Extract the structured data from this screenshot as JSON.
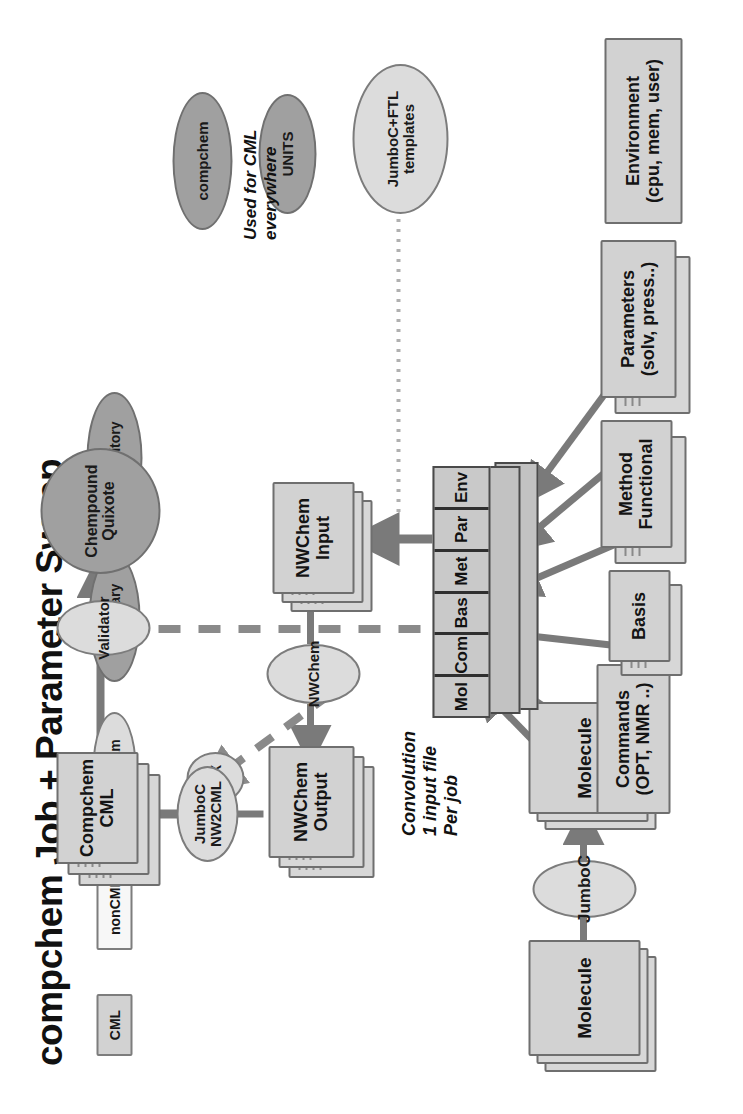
{
  "title": "compchem Job + Parameter Sweep",
  "legend": {
    "cml": "CML",
    "noncml": "nonCML",
    "program": "Program",
    "dictionary": "Dictionary",
    "repository": "Repository"
  },
  "notes": {
    "convolution": "Convolution\n1 input file\nPer job",
    "used_for_cml": "Used for CML\neverywhere"
  },
  "nodes": {
    "molecule_in": "Molecule",
    "jumboc": "JumboC",
    "molecule_cml": "Molecule",
    "commands": "Commands\n(OPT, NMR ..)",
    "basis": "Basis",
    "method": "Method\nFunctional",
    "parameters": "Parameters\n(solv, press..)",
    "environment": "Environment\n(cpu, mem, user)",
    "seg_cells": [
      "Mol",
      "Com",
      "Bas",
      "Met",
      "Par",
      "Env"
    ],
    "nwchem_input": "NWChem\nInput",
    "nwchem_prog": "NWChem",
    "nwchem_output": "NWChem\nOutput",
    "fox": "FoX",
    "jumboc_nw2cml": "JumboC\nNW2CML",
    "compchem_cml": "Compchem\nCML",
    "validator": "Validator",
    "chempound": "Chempound\nQuixote",
    "jumboc_ftl": "JumboC+FTL\ntemplates",
    "compchem_dict": "compchem",
    "units_dict": "UNITS"
  },
  "colors": {
    "cml_fill": "#d2d2d2",
    "noncml_fill": "#f7f7f7",
    "program_fill": "#dcdcdc",
    "dictionary_fill": "#a0a0a0",
    "stroke": "#6f6f6f",
    "arrow": "#7a7a7a",
    "dashed": "#8a8a8a",
    "text": "#141414"
  }
}
